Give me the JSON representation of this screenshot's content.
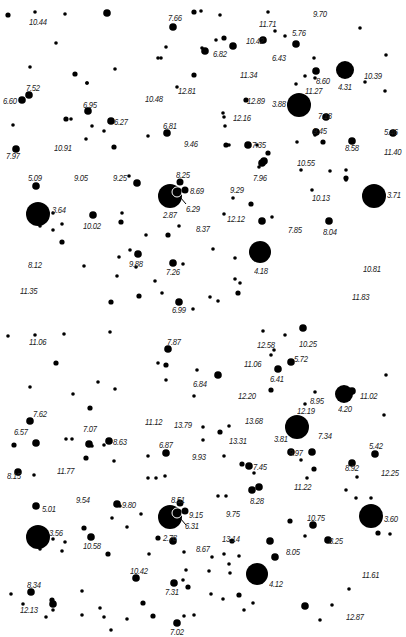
{
  "chart": {
    "panels": [
      {
        "name": "top",
        "labels": [
          {
            "text": "10.44",
            "x": 29,
            "y": 18
          },
          {
            "text": "7.66",
            "x": 168,
            "y": 14
          },
          {
            "text": "11.71",
            "x": 259,
            "y": 20
          },
          {
            "text": "9.70",
            "x": 313,
            "y": 10
          },
          {
            "text": "10.42",
            "x": 246,
            "y": 37
          },
          {
            "text": "5.76",
            "x": 292,
            "y": 29
          },
          {
            "text": "6.82",
            "x": 213,
            "y": 50
          },
          {
            "text": "6.43",
            "x": 272,
            "y": 54
          },
          {
            "text": "11.34",
            "x": 240,
            "y": 71
          },
          {
            "text": "8.60",
            "x": 316,
            "y": 77
          },
          {
            "text": "10.39",
            "x": 364,
            "y": 72
          },
          {
            "text": "11.27",
            "x": 305,
            "y": 87
          },
          {
            "text": "4.31",
            "x": 338,
            "y": 83
          },
          {
            "text": "7.52",
            "x": 26,
            "y": 84
          },
          {
            "text": "6.60",
            "x": 3,
            "y": 97
          },
          {
            "text": "6.95",
            "x": 83,
            "y": 101
          },
          {
            "text": "10.48",
            "x": 145,
            "y": 95
          },
          {
            "text": "12.81",
            "x": 178,
            "y": 87
          },
          {
            "text": "12.89",
            "x": 247,
            "y": 97
          },
          {
            "text": "3.88",
            "x": 272,
            "y": 100
          },
          {
            "text": "7.18",
            "x": 318,
            "y": 112
          },
          {
            "text": "6.27",
            "x": 114,
            "y": 118
          },
          {
            "text": "12.16",
            "x": 233,
            "y": 114
          },
          {
            "text": "6.81",
            "x": 163,
            "y": 122
          },
          {
            "text": "9.45",
            "x": 313,
            "y": 127
          },
          {
            "text": "5.46",
            "x": 384,
            "y": 128
          },
          {
            "text": "7.97",
            "x": 6,
            "y": 152
          },
          {
            "text": "10.91",
            "x": 54,
            "y": 144
          },
          {
            "text": "9.46",
            "x": 184,
            "y": 140
          },
          {
            "text": "7.35",
            "x": 252,
            "y": 141
          },
          {
            "text": "8.58",
            "x": 345,
            "y": 144
          },
          {
            "text": "11.40",
            "x": 384,
            "y": 148
          },
          {
            "text": "10.55",
            "x": 297,
            "y": 159
          },
          {
            "text": "7.96",
            "x": 253,
            "y": 174
          },
          {
            "text": "5.09",
            "x": 28,
            "y": 174
          },
          {
            "text": "9.05",
            "x": 74,
            "y": 174
          },
          {
            "text": "9.25",
            "x": 113,
            "y": 174
          },
          {
            "text": "8.25",
            "x": 176,
            "y": 171
          },
          {
            "text": "8.69",
            "x": 190,
            "y": 187
          },
          {
            "text": "9.29",
            "x": 230,
            "y": 186
          },
          {
            "text": "3.64",
            "x": 52,
            "y": 206
          },
          {
            "text": "6.29",
            "x": 186,
            "y": 205
          },
          {
            "text": "2.87",
            "x": 163,
            "y": 211
          },
          {
            "text": "10.13",
            "x": 312,
            "y": 194
          },
          {
            "text": "3.71",
            "x": 387,
            "y": 191
          },
          {
            "text": "10.02",
            "x": 83,
            "y": 222
          },
          {
            "text": "12.12",
            "x": 227,
            "y": 215
          },
          {
            "text": "8.37",
            "x": 196,
            "y": 225
          },
          {
            "text": "7.85",
            "x": 288,
            "y": 226
          },
          {
            "text": "8.04",
            "x": 323,
            "y": 228
          },
          {
            "text": "9.88",
            "x": 129,
            "y": 260
          },
          {
            "text": "8.12",
            "x": 28,
            "y": 261
          },
          {
            "text": "7.26",
            "x": 166,
            "y": 268
          },
          {
            "text": "4.18",
            "x": 254,
            "y": 267
          },
          {
            "text": "10.81",
            "x": 363,
            "y": 265
          },
          {
            "text": "11.35",
            "x": 20,
            "y": 287
          },
          {
            "text": "11.83",
            "x": 352,
            "y": 293
          },
          {
            "text": "6.99",
            "x": 172,
            "y": 306
          }
        ],
        "bright_stars": [
          {
            "mag": "2.87",
            "x": 170,
            "y": 196,
            "r": 12
          },
          {
            "mag": "3.64",
            "x": 38,
            "y": 214,
            "r": 12
          },
          {
            "mag": "3.71",
            "x": 374,
            "y": 196,
            "r": 12
          },
          {
            "mag": "3.88",
            "x": 299,
            "y": 105,
            "r": 12
          },
          {
            "mag": "4.18",
            "x": 260,
            "y": 252,
            "r": 11
          },
          {
            "mag": "4.31",
            "x": 345,
            "y": 70,
            "r": 9
          }
        ]
      },
      {
        "name": "bottom",
        "labels": [
          {
            "text": "11.06",
            "x": 29,
            "y": 338
          },
          {
            "text": "7.87",
            "x": 167,
            "y": 338
          },
          {
            "text": "12.58",
            "x": 257,
            "y": 341
          },
          {
            "text": "10.25",
            "x": 299,
            "y": 340
          },
          {
            "text": "11.06",
            "x": 244,
            "y": 360
          },
          {
            "text": "5.72",
            "x": 294,
            "y": 355
          },
          {
            "text": "6.84",
            "x": 193,
            "y": 380
          },
          {
            "text": "6.41",
            "x": 270,
            "y": 375
          },
          {
            "text": "8.95",
            "x": 310,
            "y": 397
          },
          {
            "text": "11.02",
            "x": 360,
            "y": 392
          },
          {
            "text": "4.20",
            "x": 338,
            "y": 405
          },
          {
            "text": "12.20",
            "x": 238,
            "y": 392
          },
          {
            "text": "12.19",
            "x": 297,
            "y": 407
          },
          {
            "text": "7.62",
            "x": 33,
            "y": 410
          },
          {
            "text": "6.57",
            "x": 14,
            "y": 428
          },
          {
            "text": "7.07",
            "x": 83,
            "y": 425
          },
          {
            "text": "11.12",
            "x": 145,
            "y": 418
          },
          {
            "text": "13.79",
            "x": 174,
            "y": 421
          },
          {
            "text": "13.68",
            "x": 245,
            "y": 417
          },
          {
            "text": "3.81",
            "x": 274,
            "y": 435
          },
          {
            "text": "7.34",
            "x": 318,
            "y": 432
          },
          {
            "text": "8.63",
            "x": 113,
            "y": 438
          },
          {
            "text": "6.87",
            "x": 159,
            "y": 441
          },
          {
            "text": "13.31",
            "x": 229,
            "y": 437
          },
          {
            "text": "9.93",
            "x": 192,
            "y": 453
          },
          {
            "text": "9.97",
            "x": 289,
            "y": 449
          },
          {
            "text": "5.42",
            "x": 369,
            "y": 442
          },
          {
            "text": "8.15",
            "x": 7,
            "y": 472
          },
          {
            "text": "11.77",
            "x": 57,
            "y": 467
          },
          {
            "text": "7.45",
            "x": 253,
            "y": 463
          },
          {
            "text": "8.92",
            "x": 345,
            "y": 464
          },
          {
            "text": "12.25",
            "x": 381,
            "y": 469
          },
          {
            "text": "11.22",
            "x": 294,
            "y": 483
          },
          {
            "text": "8.28",
            "x": 250,
            "y": 497
          },
          {
            "text": "5.01",
            "x": 42,
            "y": 505
          },
          {
            "text": "9.54",
            "x": 76,
            "y": 496
          },
          {
            "text": "9.80",
            "x": 122,
            "y": 501
          },
          {
            "text": "8.51",
            "x": 171,
            "y": 496
          },
          {
            "text": "9.15",
            "x": 189,
            "y": 511
          },
          {
            "text": "9.75",
            "x": 226,
            "y": 510
          },
          {
            "text": "10.75",
            "x": 307,
            "y": 514
          },
          {
            "text": "3.60",
            "x": 384,
            "y": 515
          },
          {
            "text": "3.56",
            "x": 49,
            "y": 529
          },
          {
            "text": "6.31",
            "x": 185,
            "y": 522
          },
          {
            "text": "2.78",
            "x": 163,
            "y": 534
          },
          {
            "text": "13.14",
            "x": 222,
            "y": 535
          },
          {
            "text": "8.67",
            "x": 196,
            "y": 545
          },
          {
            "text": "8.05",
            "x": 286,
            "y": 548
          },
          {
            "text": "8.25",
            "x": 329,
            "y": 537
          },
          {
            "text": "10.58",
            "x": 83,
            "y": 542
          },
          {
            "text": "10.42",
            "x": 130,
            "y": 567
          },
          {
            "text": "11.61",
            "x": 362,
            "y": 571
          },
          {
            "text": "4.12",
            "x": 269,
            "y": 580
          },
          {
            "text": "8.34",
            "x": 27,
            "y": 581
          },
          {
            "text": "7.31",
            "x": 165,
            "y": 588
          },
          {
            "text": "12.13",
            "x": 20,
            "y": 606
          },
          {
            "text": "12.87",
            "x": 346,
            "y": 613
          },
          {
            "text": "7.02",
            "x": 170,
            "y": 628
          }
        ],
        "bright_stars": [
          {
            "mag": "2.78",
            "x": 170,
            "y": 517,
            "r": 12
          },
          {
            "mag": "3.56",
            "x": 38,
            "y": 537,
            "r": 12
          },
          {
            "mag": "3.60",
            "x": 371,
            "y": 516,
            "r": 12
          },
          {
            "mag": "3.81",
            "x": 297,
            "y": 427,
            "r": 12
          },
          {
            "mag": "4.12",
            "x": 257,
            "y": 574,
            "r": 11
          },
          {
            "mag": "4.20",
            "x": 344,
            "y": 394,
            "r": 9
          }
        ]
      }
    ]
  }
}
